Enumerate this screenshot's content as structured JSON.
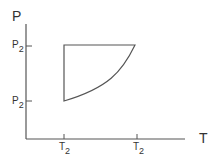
{
  "diagram": {
    "type": "P-T diagram",
    "y_axis_label": "P",
    "x_axis_label": "T",
    "y_ticks": [
      {
        "label": "P",
        "sub": "2",
        "position": "upper"
      },
      {
        "label": "P",
        "sub": "2",
        "position": "lower"
      }
    ],
    "x_ticks": [
      {
        "label": "T",
        "sub": "2",
        "position": "left"
      },
      {
        "label": "T",
        "sub": "2",
        "position": "right"
      }
    ],
    "process": {
      "description": "Closed cycle: vertical line at left T, horizontal line at upper P, curved path from lower-left to upper-right",
      "color": "#444444"
    }
  }
}
